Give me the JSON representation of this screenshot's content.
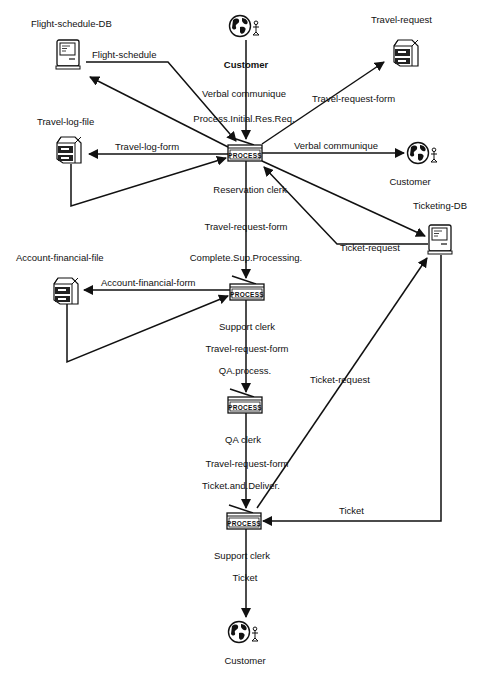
{
  "diagram": {
    "type": "workflow-process-diagram",
    "nodes": {
      "flight_schedule_db": {
        "label": "Flight-schedule-DB",
        "icon": "computer-icon"
      },
      "customer_top": {
        "label": "Customer",
        "icon": "globe-person-icon"
      },
      "travel_request": {
        "label": "Travel-request",
        "icon": "file-cabinet-icon"
      },
      "travel_log_file": {
        "label": "Travel-log-file",
        "icon": "file-cabinet-icon"
      },
      "process_1": {
        "label": "Process.Initial.Res.Req.",
        "actor": "Reservation clerk",
        "icon_text": "PROCESS"
      },
      "customer_right": {
        "label": "Customer",
        "icon": "globe-person-icon"
      },
      "ticketing_db": {
        "label": "Ticketing-DB",
        "icon": "computer-icon"
      },
      "account_financial_file": {
        "label": "Account-financial-file",
        "icon": "file-cabinet-icon"
      },
      "process_2": {
        "label": "Complete.Sup.Processing.",
        "actor": "Support clerk",
        "icon_text": "PROCESS"
      },
      "process_3": {
        "label": "QA.process.",
        "actor": "QA clerk",
        "icon_text": "PROCESS"
      },
      "process_4": {
        "label": "Ticket.and.Deliver.",
        "actor": "Support clerk",
        "icon_text": "PROCESS"
      },
      "customer_bottom": {
        "label": "Customer",
        "icon": "globe-person-icon"
      }
    },
    "edges": {
      "flight_schedule": "Flight-schedule",
      "verbal_in": "Verbal communique",
      "travel_request_form_out": "Travel-request-form",
      "travel_log_form": "Travel-log-form",
      "verbal_out": "Verbal communique",
      "travel_request_form_1": "Travel-request-form",
      "ticket_request_1": "Ticket-request",
      "account_financial_form": "Account-financial-form",
      "travel_request_form_2": "Travel-request-form",
      "ticket_request_2": "Ticket-request",
      "travel_request_form_3": "Travel-request-form",
      "ticket": "Ticket",
      "ticket_out": "Ticket"
    },
    "process_icon_text": "PROCESS"
  }
}
